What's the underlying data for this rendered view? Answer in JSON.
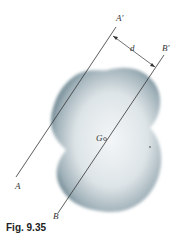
{
  "figure": {
    "caption": "Fig. 9.35",
    "labels": {
      "a": "A",
      "a_prime": "A′",
      "b": "B",
      "b_prime": "B′",
      "distance": "d",
      "centroid": "G"
    },
    "colors": {
      "body_dark": "#5e7a86",
      "body_light": "#f2f5f6",
      "line": "#333333"
    }
  }
}
